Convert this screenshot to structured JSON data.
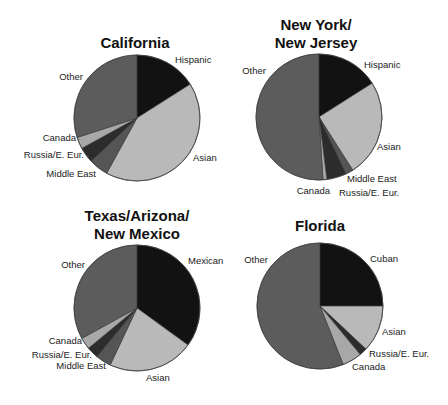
{
  "colors": {
    "primary_group": "#121212",
    "Asian": "#b9b9b9",
    "Middle East": "#555555",
    "Russia/E. Eur.": "#2c2c2c",
    "Canada": "#a8a8a8",
    "Other": "#5c5c5c",
    "stroke": "#333333"
  },
  "chart_data": [
    {
      "type": "pie",
      "title": "California",
      "title_lines": [
        "California"
      ],
      "categories": [
        "Hispanic",
        "Asian",
        "Middle East",
        "Russia/E. Eur.",
        "Canada",
        "Other"
      ],
      "values": [
        16,
        42,
        5,
        4,
        3,
        30
      ],
      "start_angle_deg": 0,
      "direction": "clockwise"
    },
    {
      "type": "pie",
      "title": "New York/ New Jersey",
      "title_lines": [
        "New York/",
        "New Jersey"
      ],
      "categories": [
        "Hispanic",
        "Asian",
        "Middle East",
        "Russia/E. Eur.",
        "Canada",
        "Other"
      ],
      "values": [
        16,
        25,
        2,
        5,
        1,
        51
      ],
      "start_angle_deg": 0,
      "direction": "clockwise"
    },
    {
      "type": "pie",
      "title": "Texas/Arizona/ New Mexico",
      "title_lines": [
        "Texas/Arizona/",
        "New Mexico"
      ],
      "categories": [
        "Mexican",
        "Asian",
        "Middle East",
        "Russia/E. Eur.",
        "Canada",
        "Other"
      ],
      "values": [
        35,
        22,
        4,
        3,
        3,
        33
      ],
      "start_angle_deg": 0,
      "direction": "clockwise"
    },
    {
      "type": "pie",
      "title": "Florida",
      "title_lines": [
        "Florida"
      ],
      "categories": [
        "Cuban",
        "Asian",
        "Russia/E. Eur.",
        "Canada",
        "Other"
      ],
      "values": [
        25,
        12,
        2,
        5,
        56
      ],
      "start_angle_deg": 0,
      "direction": "clockwise"
    }
  ],
  "layout": [
    {
      "cx": 137,
      "cy": 118,
      "r": 63,
      "title_x": 135,
      "title_y": 48,
      "labels": [
        {
          "text": "Hispanic",
          "x": 175,
          "y": 63,
          "anchor": "start"
        },
        {
          "text": "Asian",
          "x": 193,
          "y": 161,
          "anchor": "start"
        },
        {
          "text": "Middle East",
          "x": 96,
          "y": 177,
          "anchor": "end"
        },
        {
          "text": "Russia/E. Eur.",
          "x": 84,
          "y": 158,
          "anchor": "end"
        },
        {
          "text": "Canada",
          "x": 76,
          "y": 141,
          "anchor": "end"
        },
        {
          "text": "Other",
          "x": 83,
          "y": 80,
          "anchor": "end"
        }
      ]
    },
    {
      "cx": 319,
      "cy": 117,
      "r": 63,
      "title_x": 316,
      "title_y": 30,
      "title_line_h": 18,
      "labels": [
        {
          "text": "Hispanic",
          "x": 364,
          "y": 68,
          "anchor": "start"
        },
        {
          "text": "Asian",
          "x": 377,
          "y": 150,
          "anchor": "start"
        },
        {
          "text": "Middle East",
          "x": 347,
          "y": 182,
          "anchor": "start"
        },
        {
          "text": "Russia/E. Eur.",
          "x": 339,
          "y": 196,
          "anchor": "start"
        },
        {
          "text": "Canada",
          "x": 330,
          "y": 194,
          "anchor": "end"
        },
        {
          "text": "Other",
          "x": 266,
          "y": 74,
          "anchor": "end"
        }
      ]
    },
    {
      "cx": 137,
      "cy": 308,
      "r": 63,
      "title_x": 137,
      "title_y": 221,
      "title_line_h": 18,
      "labels": [
        {
          "text": "Mexican",
          "x": 188,
          "y": 264,
          "anchor": "start"
        },
        {
          "text": "Asian",
          "x": 146,
          "y": 381,
          "anchor": "start"
        },
        {
          "text": "Middle East",
          "x": 106,
          "y": 369,
          "anchor": "end"
        },
        {
          "text": "Russia/E. Eur.",
          "x": 92,
          "y": 358,
          "anchor": "end"
        },
        {
          "text": "Canada",
          "x": 82,
          "y": 344,
          "anchor": "end"
        },
        {
          "text": "Other",
          "x": 85,
          "y": 268,
          "anchor": "end"
        }
      ]
    },
    {
      "cx": 320,
      "cy": 306,
      "r": 63,
      "title_x": 320,
      "title_y": 231,
      "labels": [
        {
          "text": "Cuban",
          "x": 370,
          "y": 262,
          "anchor": "start"
        },
        {
          "text": "Asian",
          "x": 382,
          "y": 335,
          "anchor": "start"
        },
        {
          "text": "Russia/E. Eur.",
          "x": 369,
          "y": 357,
          "anchor": "start"
        },
        {
          "text": "Canada",
          "x": 352,
          "y": 370,
          "anchor": "start"
        },
        {
          "text": "Other",
          "x": 268,
          "y": 263,
          "anchor": "end"
        }
      ]
    }
  ]
}
